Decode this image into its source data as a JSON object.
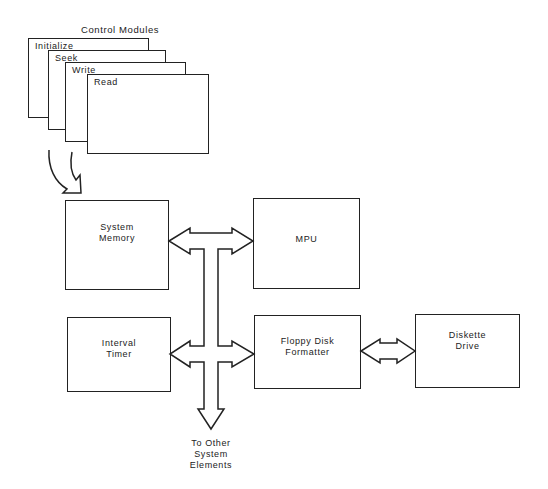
{
  "diagram": {
    "title": "Control Modules",
    "control_modules": [
      {
        "label": "Initialize"
      },
      {
        "label": "Seek"
      },
      {
        "label": "Write"
      },
      {
        "label": "Read"
      }
    ],
    "blocks": {
      "system_memory": "System\nMemory",
      "mpu": "MPU",
      "interval_timer": "Interval\nTimer",
      "floppy_disk_formatter": "Floppy Disk\nFormatter",
      "diskette_drive": "Diskette\nDrive"
    },
    "bus_caption": "To Other\nSystem\nElements",
    "connections": [
      {
        "from": "Control Modules",
        "to": "System Memory",
        "type": "curved-arrow"
      },
      {
        "from": "System Memory",
        "to": "MPU",
        "type": "bidirectional-bus"
      },
      {
        "from": "Interval Timer",
        "to": "Floppy Disk Formatter",
        "type": "bidirectional-bus"
      },
      {
        "from": "Floppy Disk Formatter",
        "to": "Diskette Drive",
        "type": "bidirectional-bus"
      },
      {
        "from": "System Bus",
        "to": "To Other System Elements",
        "type": "down-arrow"
      }
    ],
    "colors": {
      "line": "#222222",
      "background": "#ffffff"
    }
  }
}
